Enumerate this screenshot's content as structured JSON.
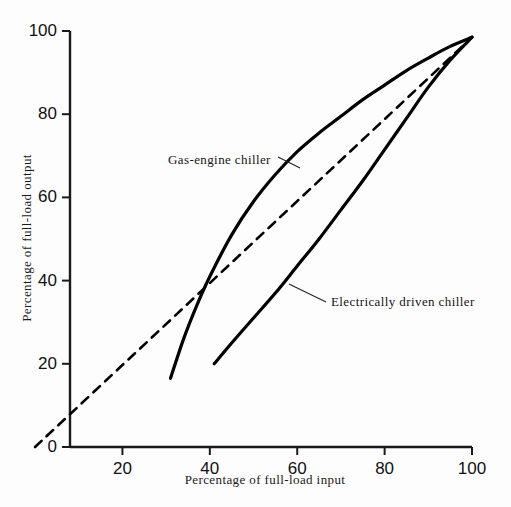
{
  "chart_data": {
    "type": "line",
    "title": "",
    "xlabel": "Percentage of full-load input",
    "ylabel": "Percentage of full-load output",
    "xlim": [
      8,
      100
    ],
    "ylim": [
      0,
      100
    ],
    "grid": false,
    "legend_position": "inline-annotations",
    "xticks": [
      "20",
      "40",
      "60",
      "80",
      "100"
    ],
    "xtick_values": [
      20,
      40,
      60,
      80,
      100
    ],
    "yticks": [
      "0",
      "20",
      "40",
      "60",
      "80",
      "100"
    ],
    "ytick_values": [
      0,
      20,
      40,
      60,
      80,
      100
    ],
    "series": [
      {
        "name": "Reference line (1:1)",
        "style": "dashed",
        "color": "#000000",
        "annotation": "",
        "points": [
          [
            0,
            0
          ],
          [
            20,
            19.7
          ],
          [
            40,
            39.4
          ],
          [
            60,
            59.1
          ],
          [
            80,
            78.8
          ],
          [
            100,
            98.5
          ]
        ]
      },
      {
        "name": "Gas-engine chiller",
        "style": "solid",
        "color": "#000000",
        "annotation": "Gas-engine chiller",
        "points": [
          [
            31,
            16.5
          ],
          [
            34,
            26
          ],
          [
            37,
            34
          ],
          [
            40,
            41
          ],
          [
            45,
            51
          ],
          [
            50,
            59
          ],
          [
            55,
            65.5
          ],
          [
            60,
            71
          ],
          [
            65,
            75.5
          ],
          [
            70,
            79.5
          ],
          [
            75,
            83.5
          ],
          [
            80,
            87
          ],
          [
            85,
            90.5
          ],
          [
            90,
            93.5
          ],
          [
            95,
            96.3
          ],
          [
            100,
            98.5
          ]
        ]
      },
      {
        "name": "Electrically driven chiller",
        "style": "solid",
        "color": "#000000",
        "annotation": "Electrically driven chiller",
        "points": [
          [
            41,
            20
          ],
          [
            45,
            25
          ],
          [
            50,
            31
          ],
          [
            55,
            37
          ],
          [
            60,
            43.5
          ],
          [
            65,
            50
          ],
          [
            70,
            57
          ],
          [
            75,
            64
          ],
          [
            80,
            71.5
          ],
          [
            85,
            79
          ],
          [
            90,
            86.5
          ],
          [
            95,
            93
          ],
          [
            100,
            98.5
          ]
        ]
      }
    ]
  },
  "annotations": {
    "gas_label": "Gas-engine chiller",
    "electric_label": "Electrically driven chiller"
  }
}
